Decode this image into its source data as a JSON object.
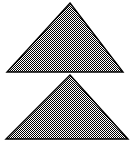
{
  "figure": {
    "width": 135,
    "height": 146,
    "background_color": "#ffffff",
    "stroke_color": "#000000",
    "stroke_width": 1.4,
    "fill_pattern": {
      "name": "checkerboard-dither-50",
      "cell_size": 1,
      "dark_color": "#000000",
      "light_color": "#ffffff",
      "effective_gray": "#808080"
    },
    "shapes": [
      {
        "id": "triangle-top",
        "name": "upper-triangle",
        "type": "triangle",
        "orientation": "point-up",
        "apex": {
          "x": 70,
          "y": 3
        },
        "base_left": {
          "x": 7,
          "y": 72
        },
        "base_right": {
          "x": 123,
          "y": 72
        },
        "points": "70,3 123,72 7,72",
        "base_width": 116,
        "height": 69,
        "fill": "checkerboard-dither-50",
        "stroke": "#000000"
      },
      {
        "id": "triangle-bottom",
        "name": "lower-triangle",
        "type": "triangle",
        "orientation": "point-up",
        "apex": {
          "x": 70,
          "y": 75
        },
        "base_left": {
          "x": 6,
          "y": 139
        },
        "base_right": {
          "x": 128,
          "y": 139
        },
        "points": "70,75 128,139 6,139",
        "base_width": 122,
        "height": 64,
        "fill": "checkerboard-dither-50",
        "stroke": "#000000"
      }
    ],
    "labels": {
      "top_triangle": "Upper triangle",
      "bottom_triangle": "Lower triangle"
    }
  }
}
